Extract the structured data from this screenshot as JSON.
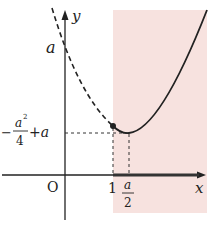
{
  "diagram": {
    "title": "",
    "shaded_region_color": "#f7e2df",
    "axis_color": "#222222",
    "curve_color": "#222222",
    "axes": {
      "x_label": "x",
      "y_label": "y",
      "origin_label": "O"
    },
    "y_ticks": {
      "intercept": "a",
      "minimum": "-a²/4 + a",
      "min_numerator": "a",
      "min_exponent": "2",
      "min_denominator": "4",
      "min_prefix": "−",
      "min_suffix": "+a"
    },
    "x_ticks": {
      "one": "1",
      "vertex_numerator": "a",
      "vertex_denominator": "2"
    },
    "curve": {
      "description": "Parabola y = x² − a x + a; dashed for x < 1, solid for x ≥ 1, minimum at x = a/2",
      "point_at_x1": "filled dot",
      "vertex_x": "a/2",
      "vertex_y": "-a²/4 + a"
    },
    "shaded_region": "x ≥ 1"
  }
}
